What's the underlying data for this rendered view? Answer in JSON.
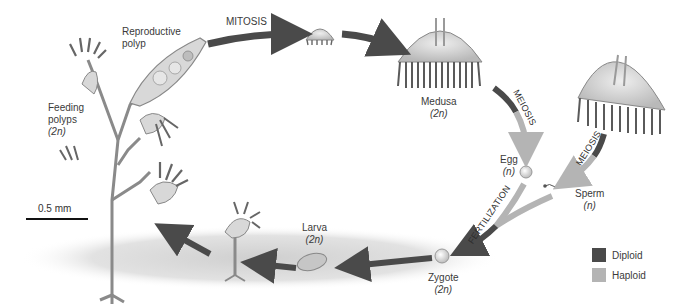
{
  "diagram": {
    "labels": {
      "reproductive_polyp": [
        "Reproductive",
        "polyp"
      ],
      "feeding_polyps": [
        "Feeding",
        "polyps",
        "(2n)"
      ],
      "mitosis": "MITOSIS",
      "medusa": [
        "Medusa",
        "(2n)"
      ],
      "meiosis_1": "MEIOSIS",
      "meiosis_2": "MEIOSIS",
      "egg": [
        "Egg",
        "(n)"
      ],
      "sperm": [
        "Sperm",
        "(n)"
      ],
      "fertilization": "FERTILIZATION",
      "zygote": [
        "Zygote",
        "(2n)"
      ],
      "larva": [
        "Larva",
        "(2n)"
      ]
    },
    "scale_bar": {
      "label": "0.5 mm"
    },
    "legend": [
      {
        "label": "Diploid",
        "color": "#4a4a4a"
      },
      {
        "label": "Haploid",
        "color": "#b4b4b4"
      }
    ],
    "colors": {
      "diploid_arrow": "#4a4a4a",
      "haploid_arrow": "#b4b4b4",
      "ground_shadow": "#d6d6d6",
      "organism_fill": "#c9c9c9",
      "organism_stroke": "#7a7a7a"
    }
  }
}
